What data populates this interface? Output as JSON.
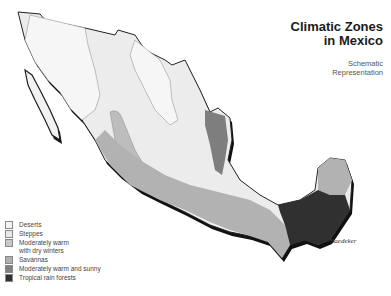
{
  "title": {
    "line1": "Climatic Zones",
    "line2": "in Mexico"
  },
  "subtitle": {
    "line1": "Schematic",
    "line2": "Representation"
  },
  "legend": [
    {
      "label": "Deserts",
      "color": "#f4f4f4"
    },
    {
      "label": "Steppes",
      "color": "#e8e8e8"
    },
    {
      "label": "Moderately warm",
      "label2": "with dry winters",
      "color": "#c8c8c8"
    },
    {
      "label": "Savannas",
      "color": "#b0b0b0"
    },
    {
      "label": "Moderately warm and sunny",
      "color": "#808080"
    },
    {
      "label": "Tropical rain forests",
      "color": "#303030"
    }
  ],
  "credit": "© Baedeker"
}
